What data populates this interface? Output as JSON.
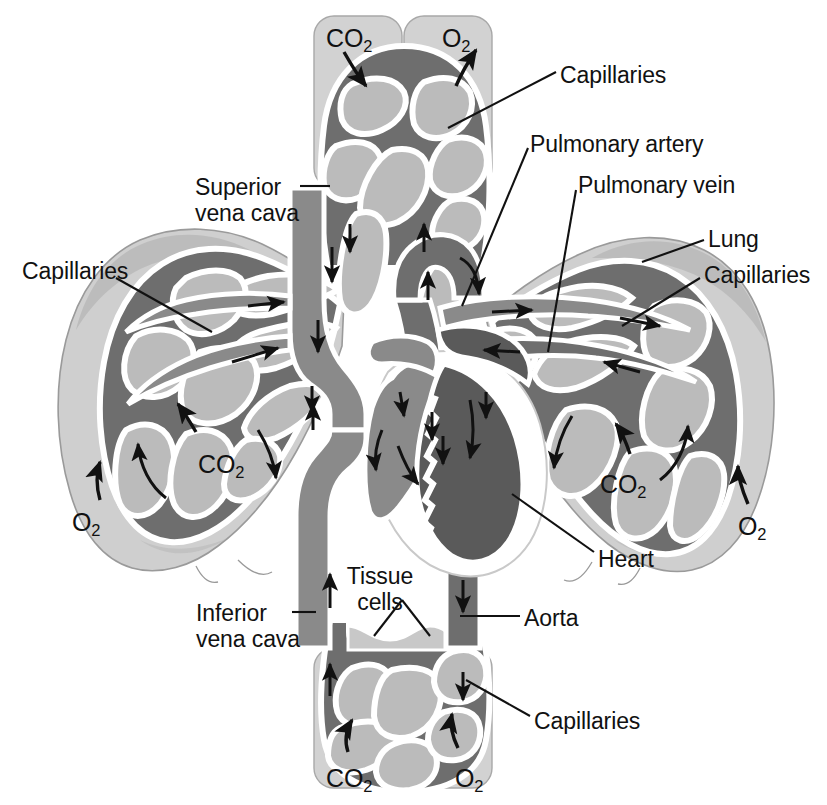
{
  "diagram": {
    "palette": {
      "background": "#ffffff",
      "deoxygenated_vessel": "#8a8a8a",
      "oxygenated_vessel": "#5e5e5e",
      "lung_tissue": "#cfcfcf",
      "lung_tissue_shadow": "#b4b4b4",
      "alveoli_fill": "#b9b9b9",
      "vessel_outline": "#ffffff",
      "tissue_block": "#d2d2d2",
      "outline_stroke": "#9a9a9a",
      "text": "#111111",
      "leader_line": "#111111",
      "arrow": "#111111"
    },
    "labels": [
      {
        "id": "co2-top",
        "text": "CO",
        "sub": "2",
        "x": 326,
        "y": 24,
        "align": "left",
        "type": "gas"
      },
      {
        "id": "o2-top",
        "text": "O",
        "sub": "2",
        "x": 442,
        "y": 24,
        "align": "left",
        "type": "gas"
      },
      {
        "id": "capillaries-top",
        "text": "Capillaries",
        "sub": null,
        "x": 560,
        "y": 62,
        "align": "left",
        "type": "text"
      },
      {
        "id": "pulmonary-artery",
        "text": "Pulmonary artery",
        "sub": null,
        "x": 530,
        "y": 131,
        "align": "left",
        "type": "text"
      },
      {
        "id": "pulmonary-vein",
        "text": "Pulmonary vein",
        "sub": null,
        "x": 578,
        "y": 172,
        "align": "left",
        "type": "text"
      },
      {
        "id": "superior-vena-cava",
        "text": "Superior\nvena cava",
        "sub": null,
        "x": 195,
        "y": 174,
        "align": "left",
        "type": "text"
      },
      {
        "id": "lung-right",
        "text": "Lung",
        "sub": null,
        "x": 708,
        "y": 226,
        "align": "left",
        "type": "text"
      },
      {
        "id": "capillaries-left",
        "text": "Capillaries",
        "sub": null,
        "x": 22,
        "y": 258,
        "align": "left",
        "type": "text"
      },
      {
        "id": "capillaries-right",
        "text": "Capillaries",
        "sub": null,
        "x": 704,
        "y": 262,
        "align": "left",
        "type": "text"
      },
      {
        "id": "co2-left-lung",
        "text": "CO",
        "sub": "2",
        "x": 198,
        "y": 450,
        "align": "left",
        "type": "gas"
      },
      {
        "id": "co2-right-lung",
        "text": "CO",
        "sub": "2",
        "x": 600,
        "y": 470,
        "align": "left",
        "type": "gas"
      },
      {
        "id": "o2-left-lung",
        "text": "O",
        "sub": "2",
        "x": 72,
        "y": 508,
        "align": "left",
        "type": "gas"
      },
      {
        "id": "o2-right-lung",
        "text": "O",
        "sub": "2",
        "x": 738,
        "y": 512,
        "align": "left",
        "type": "gas"
      },
      {
        "id": "heart",
        "text": "Heart",
        "sub": null,
        "x": 598,
        "y": 546,
        "align": "left",
        "type": "text"
      },
      {
        "id": "tissue-cells",
        "text": "Tissue\ncells",
        "sub": null,
        "x": 380,
        "y": 563,
        "align": "center",
        "type": "text"
      },
      {
        "id": "inferior-vena-cava",
        "text": "Inferior\nvena cava",
        "sub": null,
        "x": 196,
        "y": 600,
        "align": "left",
        "type": "text"
      },
      {
        "id": "aorta",
        "text": "Aorta",
        "sub": null,
        "x": 524,
        "y": 605,
        "align": "left",
        "type": "text"
      },
      {
        "id": "capillaries-bottom",
        "text": "Capillaries",
        "sub": null,
        "x": 534,
        "y": 708,
        "align": "left",
        "type": "text"
      },
      {
        "id": "co2-bottom",
        "text": "CO",
        "sub": "2",
        "x": 326,
        "y": 764,
        "align": "left",
        "type": "gas"
      },
      {
        "id": "o2-bottom",
        "text": "O",
        "sub": "2",
        "x": 455,
        "y": 764,
        "align": "left",
        "type": "gas"
      }
    ],
    "parts": [
      {
        "id": "lung-left",
        "name": "left lung"
      },
      {
        "id": "lung-right",
        "name": "right lung"
      },
      {
        "id": "heart",
        "name": "heart"
      },
      {
        "id": "superior-vena-cava",
        "name": "superior vena cava"
      },
      {
        "id": "inferior-vena-cava",
        "name": "inferior vena cava"
      },
      {
        "id": "aorta",
        "name": "aorta"
      },
      {
        "id": "pulmonary-artery",
        "name": "pulmonary artery"
      },
      {
        "id": "pulmonary-vein",
        "name": "pulmonary vein"
      },
      {
        "id": "capillary-bed-head",
        "name": "head capillary bed"
      },
      {
        "id": "capillary-bed-body",
        "name": "lower body capillary bed"
      },
      {
        "id": "tissue-cells",
        "name": "tissue cells"
      }
    ]
  }
}
